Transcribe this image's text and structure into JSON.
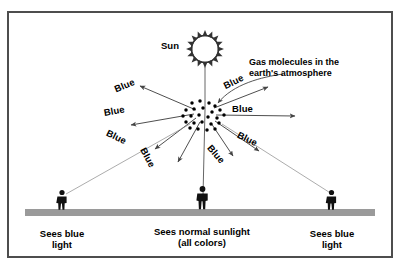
{
  "figure": {
    "background_color": "#ffffff",
    "border_color": "#4d4d4d",
    "ground_color": "#9a9a9a",
    "ink_color": "#000000",
    "ray_color": "#555555"
  },
  "sun": {
    "label": "Sun",
    "icon": "sun-icon",
    "ray_count": 16
  },
  "annotation": {
    "gas_label_line1": "Gas molecules in the",
    "gas_label_line2": "earth's atmosphere",
    "gas_label_full": "Gas molecules in the earth's atmosphere"
  },
  "scattered_labels": [
    {
      "text": "Blue",
      "rotation": -22,
      "x": 113,
      "y": 85,
      "name": "blue-label-upper-left"
    },
    {
      "text": "Blue",
      "rotation": -10,
      "x": 103,
      "y": 108,
      "name": "blue-label-mid-left"
    },
    {
      "text": "Blue",
      "rotation": 26,
      "x": 109,
      "y": 128,
      "name": "blue-label-lower-left"
    },
    {
      "text": "Blue",
      "rotation": 62,
      "x": 147,
      "y": 146,
      "name": "blue-label-steep-left"
    },
    {
      "text": "Blue",
      "rotation": -26,
      "x": 222,
      "y": 82,
      "name": "blue-label-upper-right"
    },
    {
      "text": "Blue",
      "rotation": 0,
      "x": 232,
      "y": 104,
      "name": "blue-label-mid-right"
    },
    {
      "text": "Blue",
      "rotation": 26,
      "x": 240,
      "y": 130,
      "name": "blue-label-lower-right"
    },
    {
      "text": "Blue",
      "rotation": 50,
      "x": 213,
      "y": 143,
      "name": "blue-label-steep-right"
    }
  ],
  "observers": [
    {
      "name": "observer-left",
      "caption": "Sees blue\nlight",
      "x": 62,
      "y": 200
    },
    {
      "name": "observer-center",
      "caption": "Sees normal sunlight\n(all colors)",
      "x": 201,
      "y": 196
    },
    {
      "name": "observer-right",
      "caption": "Sees blue\nlight",
      "x": 331,
      "y": 200
    }
  ],
  "molecules": {
    "label": "gas-molecule-dots",
    "count": 24
  }
}
